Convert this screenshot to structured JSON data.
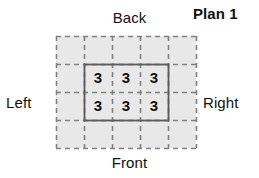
{
  "title": "Plan 1",
  "orientation_labels": {
    "back": "Back",
    "front": "Front",
    "left": "Left",
    "right": "Right"
  },
  "diagram": {
    "type": "mat-plan-grid",
    "grid_columns": 5,
    "grid_rows": 4,
    "grid_fill_color": "#e8e8e8",
    "grid_line_color": "#808080",
    "grid_line_style": "dashed",
    "footprint_outline_color": "#5a5a5a",
    "footprint_outline_style": "solid",
    "footprint_columns": 3,
    "footprint_rows": 2,
    "footprint_origin_column": 1,
    "footprint_origin_row": 1,
    "cell_values": [
      [
        "3",
        "3",
        "3"
      ],
      [
        "3",
        "3",
        "3"
      ]
    ],
    "cell_values_flat": [
      "3",
      "3",
      "3",
      "3",
      "3",
      "3"
    ]
  }
}
